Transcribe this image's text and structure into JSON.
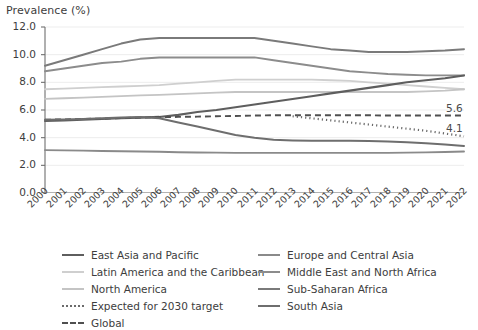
{
  "chart_data": {
    "type": "line",
    "title": "",
    "ylabel": "Prevalence (%)",
    "xlabel": "",
    "ylim": [
      0.0,
      12.0
    ],
    "yticks": [
      "0.0",
      "2.0",
      "4.0",
      "6.0",
      "8.0",
      "10.0",
      "12.0"
    ],
    "ytick_values": [
      0,
      2,
      4,
      6,
      8,
      10,
      12
    ],
    "grid": true,
    "legend_position": "bottom",
    "x": [
      2000,
      2001,
      2002,
      2003,
      2004,
      2005,
      2006,
      2007,
      2008,
      2009,
      2010,
      2011,
      2012,
      2013,
      2014,
      2015,
      2016,
      2017,
      2018,
      2019,
      2020,
      2021,
      2022
    ],
    "xtick_labels": [
      "2000",
      "2001",
      "2002",
      "2003",
      "2004",
      "2005",
      "2006",
      "2007",
      "2008",
      "2009",
      "2010",
      "2011",
      "2012",
      "2013",
      "2014",
      "2015",
      "2016",
      "2017",
      "2018",
      "2019",
      "2020",
      "2021",
      "2022"
    ],
    "series": [
      {
        "name": "Sub-Saharan Africa",
        "color": "#7a7a7a",
        "style": "solid",
        "width": 2.0,
        "values": [
          9.2,
          9.6,
          10.0,
          10.4,
          10.8,
          11.1,
          11.2,
          11.2,
          11.2,
          11.2,
          11.2,
          11.2,
          11.0,
          10.8,
          10.6,
          10.4,
          10.3,
          10.2,
          10.2,
          10.2,
          10.25,
          10.3,
          10.4
        ]
      },
      {
        "name": "Middle East and North Africa",
        "color": "#8c8c8c",
        "style": "solid",
        "width": 1.9,
        "values": [
          8.8,
          9.0,
          9.2,
          9.4,
          9.5,
          9.7,
          9.8,
          9.8,
          9.8,
          9.8,
          9.8,
          9.8,
          9.6,
          9.4,
          9.2,
          9.0,
          8.8,
          8.7,
          8.6,
          8.55,
          8.5,
          8.5,
          8.5
        ]
      },
      {
        "name": "Latin America and the Caribbean",
        "color": "#cfcfcf",
        "style": "solid",
        "width": 1.8,
        "values": [
          7.5,
          7.55,
          7.6,
          7.65,
          7.7,
          7.75,
          7.8,
          7.9,
          8.0,
          8.1,
          8.2,
          8.2,
          8.2,
          8.2,
          8.2,
          8.15,
          8.1,
          8.0,
          7.9,
          7.8,
          7.7,
          7.6,
          7.5
        ]
      },
      {
        "name": "North America",
        "color": "#c4c4c4",
        "style": "solid",
        "width": 1.8,
        "values": [
          6.8,
          6.85,
          6.9,
          6.95,
          7.0,
          7.05,
          7.1,
          7.15,
          7.2,
          7.25,
          7.3,
          7.3,
          7.3,
          7.3,
          7.3,
          7.3,
          7.3,
          7.3,
          7.3,
          7.3,
          7.35,
          7.4,
          7.5
        ]
      },
      {
        "name": "East Asia and Pacific",
        "color": "#5e5e5e",
        "style": "solid",
        "width": 2.1,
        "values": [
          5.2,
          5.25,
          5.3,
          5.35,
          5.4,
          5.45,
          5.5,
          5.65,
          5.85,
          6.0,
          6.2,
          6.4,
          6.6,
          6.8,
          7.0,
          7.2,
          7.4,
          7.6,
          7.8,
          8.0,
          8.15,
          8.3,
          8.5
        ]
      },
      {
        "name": "Global",
        "color": "#4f4f4f",
        "style": "dashed",
        "width": 1.9,
        "values": [
          5.3,
          5.32,
          5.35,
          5.38,
          5.42,
          5.45,
          5.48,
          5.5,
          5.52,
          5.55,
          5.57,
          5.6,
          5.62,
          5.62,
          5.62,
          5.62,
          5.62,
          5.62,
          5.6,
          5.6,
          5.6,
          5.6,
          5.6
        ],
        "end_label": "5.6"
      },
      {
        "name": "South Asia",
        "color": "#6e6e6e",
        "style": "solid",
        "width": 2.0,
        "values": [
          5.3,
          5.32,
          5.35,
          5.4,
          5.45,
          5.5,
          5.4,
          5.1,
          4.8,
          4.5,
          4.2,
          4.0,
          3.85,
          3.8,
          3.78,
          3.78,
          3.78,
          3.76,
          3.72,
          3.66,
          3.6,
          3.5,
          3.4
        ]
      },
      {
        "name": "Europe and Central Asia",
        "color": "#8a8a8a",
        "style": "solid",
        "width": 1.9,
        "values": [
          3.1,
          3.08,
          3.06,
          3.04,
          3.02,
          3.0,
          2.98,
          2.95,
          2.93,
          2.92,
          2.9,
          2.9,
          2.9,
          2.9,
          2.9,
          2.9,
          2.9,
          2.9,
          2.9,
          2.92,
          2.94,
          2.96,
          3.0
        ]
      },
      {
        "name": "Expected for 2030 target",
        "color": "#6b6b6b",
        "style": "dotted",
        "width": 2.2,
        "start_year": 2013,
        "values": [
          null,
          null,
          null,
          null,
          null,
          null,
          null,
          null,
          null,
          null,
          null,
          null,
          null,
          5.55,
          5.4,
          5.25,
          5.1,
          4.95,
          4.8,
          4.65,
          4.5,
          4.3,
          4.1
        ],
        "end_label": "4.1"
      }
    ],
    "annotations": [
      {
        "text": "5.6",
        "x": 2022,
        "y": 5.6
      },
      {
        "text": "4.1",
        "x": 2022,
        "y": 4.1
      }
    ]
  },
  "legend": {
    "left_column": [
      {
        "label": "East Asia and Pacific",
        "color": "#5e5e5e",
        "style": "solid"
      },
      {
        "label": "Latin America and the Caribbean",
        "color": "#cfcfcf",
        "style": "solid"
      },
      {
        "label": "North America",
        "color": "#c4c4c4",
        "style": "solid"
      },
      {
        "label": "Expected for 2030 target",
        "color": "#6b6b6b",
        "style": "dotted"
      },
      {
        "label": "Global",
        "color": "#4f4f4f",
        "style": "dashed"
      }
    ],
    "right_column": [
      {
        "label": "Europe and Central Asia",
        "color": "#8a8a8a",
        "style": "solid"
      },
      {
        "label": "Middle East and North Africa",
        "color": "#8c8c8c",
        "style": "solid"
      },
      {
        "label": "Sub-Saharan Africa",
        "color": "#7a7a7a",
        "style": "solid"
      },
      {
        "label": "South Asia",
        "color": "#6e6e6e",
        "style": "solid"
      }
    ]
  },
  "colors": {
    "axis": "#6f6f6f",
    "grid": "#ededed",
    "text": "#3d3d3d",
    "background": "#ffffff"
  }
}
